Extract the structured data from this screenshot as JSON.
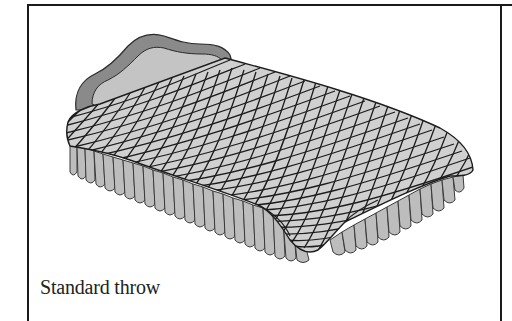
{
  "figure": {
    "caption": "Standard throw",
    "colors": {
      "frame": "#1a1a1a",
      "headboard_outer": "#8a8a8a",
      "headboard_inner": "#c4c4c4",
      "quilt_fill": "#d0d0d0",
      "quilt_grid": "#1c1c1c",
      "skirt_fill": "#bdbdbd",
      "skirt_outline": "#3a3a3a",
      "caption_text": "#222222",
      "background": "#ffffff"
    }
  }
}
